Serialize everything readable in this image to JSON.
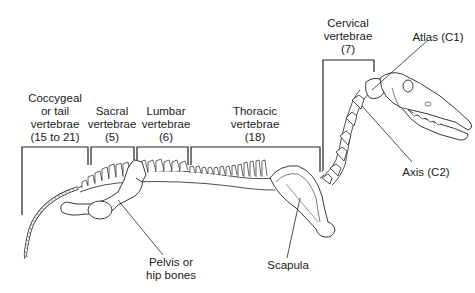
{
  "diagram": {
    "labels": {
      "coccygeal": [
        "Coccygeal",
        "or tail",
        "vertebrae",
        "(15 to 21)"
      ],
      "sacral": [
        "Sacral",
        "vertebrae",
        "(5)"
      ],
      "lumbar": [
        "Lumbar",
        "vertebrae",
        "(6)"
      ],
      "thoracic": [
        "Thoracic",
        "vertebrae",
        "(18)"
      ],
      "cervical": [
        "Cervical",
        "vertebrae",
        "(7)"
      ],
      "atlas": "Atlas (C1)",
      "axis": "Axis (C2)",
      "pelvis": [
        "Pelvis or",
        "hip bones"
      ],
      "scapula": "Scapula"
    },
    "colors": {
      "line": "#222222",
      "bone_fill": "#ffffff",
      "background": "#ffffff"
    }
  }
}
